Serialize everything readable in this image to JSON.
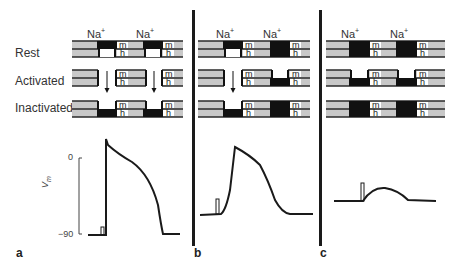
{
  "figure": {
    "row_labels": [
      "Rest",
      "Activated",
      "Inactivated"
    ],
    "ion_label": "Na",
    "ion_charge": "+",
    "gate_labels": {
      "m": "m",
      "h": "h"
    },
    "panels": [
      {
        "letter": "a"
      },
      {
        "letter": "b"
      },
      {
        "letter": "c"
      }
    ],
    "axis": {
      "ylabel": "V",
      "ylabel_sub": "m",
      "top_tick": "0",
      "bottom_tick": "−90"
    },
    "colors": {
      "membrane_light": "#c8c8c8",
      "membrane_line": "#2a2a2a",
      "channel_dark": "#111111",
      "trace": "#1a1a1a"
    }
  }
}
